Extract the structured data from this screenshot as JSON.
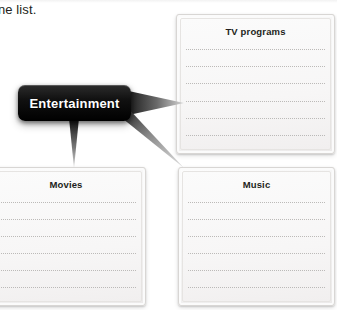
{
  "page": {
    "intro_text": "ne list.",
    "background_color": "#ffffff"
  },
  "callout": {
    "label": "Entertainment",
    "fill_color": "#000000",
    "text_color": "#ffffff"
  },
  "boxes": [
    {
      "id": "tv-programs",
      "title": "TV programs",
      "line_count": 6,
      "line_color": "#b9b7b5",
      "fill_color": "#f7f6f6"
    },
    {
      "id": "movies",
      "title": "Movies",
      "line_count": 6,
      "line_color": "#b9b7b5",
      "fill_color": "#f7f6f6"
    },
    {
      "id": "music",
      "title": "Music",
      "line_count": 6,
      "line_color": "#b9b7b5",
      "fill_color": "#f7f6f6"
    }
  ],
  "connectors": [
    {
      "id": "to-tv-programs",
      "from": "Entertainment",
      "to": "TV programs",
      "direction": "right"
    },
    {
      "id": "to-movies",
      "from": "Entertainment",
      "to": "Movies",
      "direction": "down"
    },
    {
      "id": "to-music",
      "from": "Entertainment",
      "to": "Music",
      "direction": "down-right"
    }
  ]
}
